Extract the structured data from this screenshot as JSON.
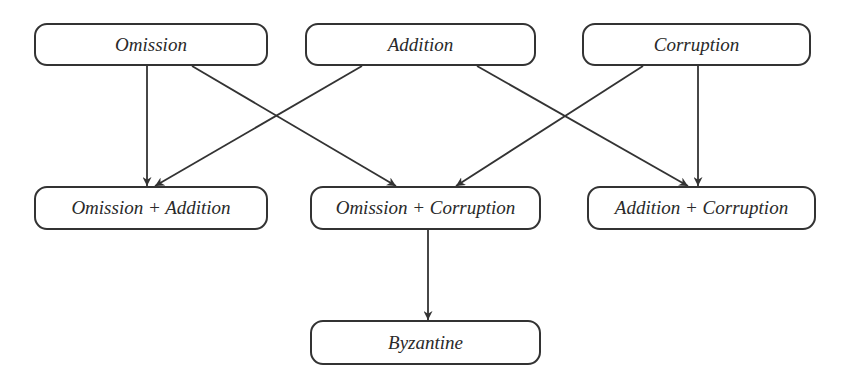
{
  "diagram": {
    "type": "failure-model-hierarchy",
    "colors": {
      "stroke": "#333333",
      "text": "#2a2a2a",
      "background": "#ffffff"
    },
    "nodes": [
      {
        "id": "omission",
        "label": "Omission",
        "x": 34,
        "y": 23,
        "w": 234,
        "h": 43
      },
      {
        "id": "addition",
        "label": "Addition",
        "x": 305,
        "y": 23,
        "w": 231,
        "h": 43
      },
      {
        "id": "corruption",
        "label": "Corruption",
        "x": 582,
        "y": 23,
        "w": 229,
        "h": 43
      },
      {
        "id": "omission-addition",
        "label": "Omission + Addition",
        "x": 34,
        "y": 186,
        "w": 234,
        "h": 44
      },
      {
        "id": "omission-corruption",
        "label": "Omission + Corruption",
        "x": 310,
        "y": 186,
        "w": 231,
        "h": 44
      },
      {
        "id": "addition-corruption",
        "label": "Addition + Corruption",
        "x": 587,
        "y": 186,
        "w": 229,
        "h": 44
      },
      {
        "id": "byzantine",
        "label": "Byzantine",
        "x": 310,
        "y": 320,
        "w": 231,
        "h": 45
      }
    ],
    "edges": [
      {
        "from": "omission",
        "to": "omission-addition",
        "x1": 147,
        "y1": 66,
        "x2": 147,
        "y2": 186
      },
      {
        "from": "omission",
        "to": "omission-corruption",
        "x1": 192,
        "y1": 66,
        "x2": 396,
        "y2": 186
      },
      {
        "from": "addition",
        "to": "omission-addition",
        "x1": 362,
        "y1": 66,
        "x2": 155,
        "y2": 186
      },
      {
        "from": "addition",
        "to": "addition-corruption",
        "x1": 477,
        "y1": 66,
        "x2": 688,
        "y2": 186
      },
      {
        "from": "corruption",
        "to": "omission-corruption",
        "x1": 643,
        "y1": 66,
        "x2": 456,
        "y2": 186
      },
      {
        "from": "corruption",
        "to": "addition-corruption",
        "x1": 698,
        "y1": 66,
        "x2": 698,
        "y2": 186
      },
      {
        "from": "omission-corruption",
        "to": "byzantine",
        "x1": 428,
        "y1": 230,
        "x2": 428,
        "y2": 320
      }
    ]
  }
}
